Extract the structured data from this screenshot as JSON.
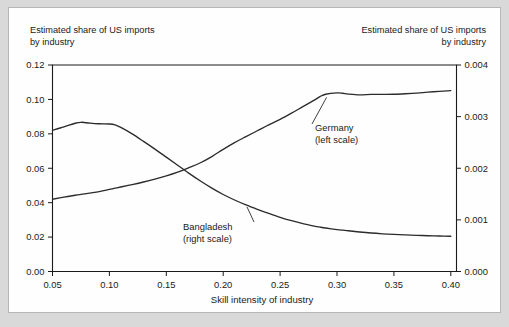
{
  "figure": {
    "background_color": "#d9d9d9",
    "panel_color": "#ffffff",
    "border_color": "#b6b6b6"
  },
  "titles": {
    "left": "Estimated share of US imports\nby industry",
    "right": "Estimated share of US imports\nby industry"
  },
  "chart_data": {
    "type": "line",
    "title": "Estimated share of US imports by industry",
    "xlabel": "Skill intensity of industry",
    "ylabel": "Estimated share of US imports by industry",
    "ylabel_right": "Estimated share of US imports by industry",
    "grid": false,
    "legend": "annotations-on-plot",
    "xlim": [
      0.05,
      0.405
    ],
    "ylim": [
      0.0,
      0.12
    ],
    "ylim_right": [
      0.0,
      0.004
    ],
    "xticks": [
      0.05,
      0.1,
      0.15,
      0.2,
      0.25,
      0.3,
      0.35,
      0.4
    ],
    "xticklabels": [
      "0.05",
      "0.10",
      "0.15",
      "0.20",
      "0.25",
      "0.30",
      "0.35",
      "0.40"
    ],
    "yticks": [
      0.0,
      0.02,
      0.04,
      0.06,
      0.08,
      0.1,
      0.12
    ],
    "yticklabels": [
      "0.00",
      "0.02",
      "0.04",
      "0.06",
      "0.08",
      "0.10",
      "0.12"
    ],
    "yticks_right": [
      0.0,
      0.001,
      0.002,
      0.003,
      0.004
    ],
    "yticklabels_right": [
      "0.000",
      "0.001",
      "0.002",
      "0.003",
      "0.004"
    ],
    "line_color": "#2b2b2b",
    "x": [
      0.05,
      0.06,
      0.07,
      0.075,
      0.08,
      0.09,
      0.1,
      0.105,
      0.11,
      0.12,
      0.13,
      0.14,
      0.15,
      0.16,
      0.17,
      0.18,
      0.19,
      0.2,
      0.21,
      0.22,
      0.23,
      0.24,
      0.25,
      0.26,
      0.27,
      0.28,
      0.285,
      0.29,
      0.3,
      0.305,
      0.31,
      0.32,
      0.33,
      0.34,
      0.35,
      0.36,
      0.37,
      0.38,
      0.39,
      0.4
    ],
    "series": [
      {
        "name": "Germany",
        "scale": "left",
        "axis_label": "Germany (left scale)",
        "annotation": "Germany\n(left scale)",
        "values": [
          0.042,
          0.0432,
          0.0443,
          0.0448,
          0.0453,
          0.0463,
          0.0477,
          0.0484,
          0.0491,
          0.0505,
          0.052,
          0.0537,
          0.0556,
          0.0578,
          0.0604,
          0.0632,
          0.0668,
          0.071,
          0.0749,
          0.0784,
          0.0818,
          0.0852,
          0.0884,
          0.092,
          0.0958,
          0.0996,
          0.1016,
          0.103,
          0.1038,
          0.1036,
          0.1031,
          0.1026,
          0.1029,
          0.1029,
          0.103,
          0.1033,
          0.1037,
          0.1042,
          0.1047,
          0.1051
        ]
      },
      {
        "name": "Bangladesh",
        "scale": "right",
        "axis_label": "Bangladesh (right scale)",
        "annotation": "Bangladesh\n(right scale)",
        "values": [
          0.002735,
          0.0028,
          0.002872,
          0.00289,
          0.002882,
          0.002862,
          0.002858,
          0.00284,
          0.00279,
          0.002665,
          0.00252,
          0.00237,
          0.002215,
          0.002058,
          0.0019,
          0.001752,
          0.001615,
          0.001492,
          0.001385,
          0.00129,
          0.001205,
          0.001125,
          0.00105,
          0.000985,
          0.000928,
          0.00088,
          0.00086,
          0.000842,
          0.000812,
          0.0008,
          0.00079,
          0.000765,
          0.000745,
          0.00073,
          0.000718,
          0.000708,
          0.0007,
          0.000693,
          0.000687,
          0.000682
        ]
      }
    ],
    "crossing_point": {
      "x": 0.157,
      "y_left": 0.059
    }
  },
  "annotations": {
    "germany": {
      "line1": "Germany",
      "line2": "(left scale)"
    },
    "bangladesh": {
      "line1": "Bangladesh",
      "line2": "(right scale)"
    }
  },
  "axis": {
    "x_title": "Skill intensity of industry"
  }
}
